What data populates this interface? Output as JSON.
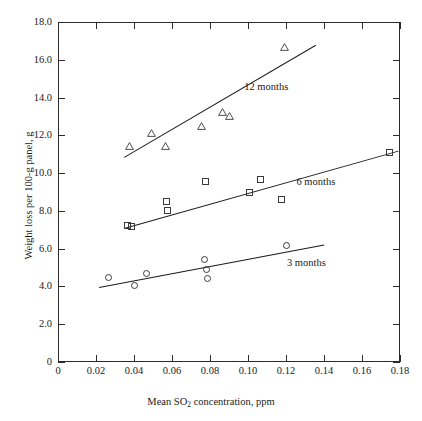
{
  "chart_data": {
    "type": "scatter",
    "title": "",
    "xlabel": "Mean SO2 concentration, ppm",
    "xlabel_rich": "Mean SO₂ concentration, ppm",
    "ylabel": "Weight loss per 100-g panel, g",
    "xlim": [
      0,
      0.18
    ],
    "ylim": [
      0,
      18.0
    ],
    "xticks": [
      0,
      0.02,
      0.04,
      0.06,
      0.08,
      0.1,
      0.12,
      0.14,
      0.16,
      0.18
    ],
    "xtick_labels": [
      "0",
      "0.02",
      "0.04",
      "0.06",
      "0.08",
      "0.10",
      "0.12",
      "0.14",
      "0.16",
      "0.18"
    ],
    "yticks": [
      0,
      2.0,
      4.0,
      6.0,
      8.0,
      10.0,
      12.0,
      14.0,
      16.0,
      18.0
    ],
    "ytick_labels": [
      "0",
      "2.0",
      "4.0",
      "6.0",
      "8.0",
      "10.0",
      "12.0",
      "14.0",
      "16.0",
      "18.0"
    ],
    "grid": false,
    "legend_position": "inline-annotation",
    "series": [
      {
        "name": "12 months",
        "marker": "triangle",
        "label": "12 months",
        "label_x": 0.098,
        "label_y": 14.55,
        "points": [
          {
            "x": 0.0375,
            "y": 11.42
          },
          {
            "x": 0.049,
            "y": 12.12
          },
          {
            "x": 0.0565,
            "y": 11.45
          },
          {
            "x": 0.0755,
            "y": 12.5
          },
          {
            "x": 0.0865,
            "y": 13.22
          },
          {
            "x": 0.09,
            "y": 13.05
          },
          {
            "x": 0.119,
            "y": 16.7
          }
        ],
        "fit_line": {
          "x1": 0.0345,
          "y1": 10.85,
          "x2": 0.1355,
          "y2": 16.8
        }
      },
      {
        "name": "6 months",
        "marker": "square",
        "label": "6 months",
        "label_x": 0.1255,
        "label_y": 9.55,
        "points": [
          {
            "x": 0.0365,
            "y": 7.22
          },
          {
            "x": 0.0385,
            "y": 7.2
          },
          {
            "x": 0.057,
            "y": 8.52
          },
          {
            "x": 0.0575,
            "y": 8.0
          },
          {
            "x": 0.0775,
            "y": 9.55
          },
          {
            "x": 0.101,
            "y": 9.0
          },
          {
            "x": 0.1065,
            "y": 9.68
          },
          {
            "x": 0.1175,
            "y": 8.6
          },
          {
            "x": 0.1745,
            "y": 11.1
          }
        ],
        "fit_line": {
          "x1": 0.0345,
          "y1": 7.1,
          "x2": 0.179,
          "y2": 11.2
        }
      },
      {
        "name": "3 months",
        "marker": "circle",
        "label": "3 months",
        "label_x": 0.1205,
        "label_y": 5.25,
        "points": [
          {
            "x": 0.0265,
            "y": 4.45
          },
          {
            "x": 0.04,
            "y": 4.05
          },
          {
            "x": 0.0465,
            "y": 4.7
          },
          {
            "x": 0.077,
            "y": 5.45
          },
          {
            "x": 0.078,
            "y": 4.88
          },
          {
            "x": 0.0785,
            "y": 4.4
          },
          {
            "x": 0.12,
            "y": 6.15
          }
        ],
        "fit_line": {
          "x1": 0.0215,
          "y1": 3.95,
          "x2": 0.14,
          "y2": 6.2
        }
      }
    ]
  }
}
